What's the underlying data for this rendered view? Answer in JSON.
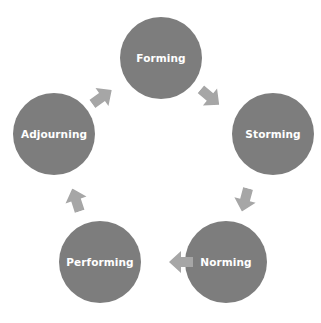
{
  "diagram": {
    "type": "cycle",
    "colors": {
      "node": "#7d7d7d",
      "arrow": "#a6a6a6",
      "text": "#ffffff",
      "background": "#ffffff"
    },
    "nodes": [
      {
        "id": "forming",
        "label": "Forming"
      },
      {
        "id": "storming",
        "label": "Storming"
      },
      {
        "id": "norming",
        "label": "Norming"
      },
      {
        "id": "performing",
        "label": "Performing"
      },
      {
        "id": "adjourning",
        "label": "Adjourning"
      }
    ],
    "edges": [
      {
        "from": "Forming",
        "to": "Storming"
      },
      {
        "from": "Storming",
        "to": "Norming"
      },
      {
        "from": "Norming",
        "to": "Performing"
      },
      {
        "from": "Performing",
        "to": "Adjourning"
      },
      {
        "from": "Adjourning",
        "to": "Forming"
      }
    ]
  }
}
